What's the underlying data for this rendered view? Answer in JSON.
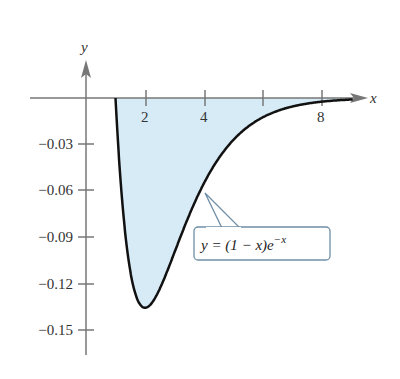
{
  "chart_data": {
    "type": "area",
    "title": "",
    "function_label": "y = (1 − x)e^{−x}",
    "xlabel": "x",
    "ylabel": "y",
    "xlim": [
      -0.2,
      9.2
    ],
    "ylim": [
      -0.15,
      0.0
    ],
    "x_ticks": [
      2,
      4,
      6,
      8
    ],
    "x_tick_labels": [
      "2",
      "4",
      "",
      "8"
    ],
    "y_ticks": [
      -0.03,
      -0.06,
      -0.09,
      -0.12,
      -0.15
    ],
    "y_tick_labels": [
      "−0.03",
      "−0.06",
      "−0.09",
      "−0.12",
      "−0.15"
    ],
    "grid": false,
    "legend": null,
    "shaded_region": {
      "from_x": 1,
      "to_x": 9,
      "fill": "#d7ebf7",
      "between": "curve and x-axis"
    },
    "series": [
      {
        "name": "y = (1 − x)e^{−x}",
        "x": [
          1,
          1.25,
          1.5,
          1.75,
          2,
          2.5,
          3,
          3.5,
          4,
          4.5,
          5,
          5.5,
          6,
          6.5,
          7,
          7.5,
          8,
          8.5,
          9
        ],
        "y": [
          0,
          -0.0716,
          -0.1116,
          -0.1303,
          -0.1353,
          -0.1231,
          -0.0996,
          -0.0755,
          -0.0549,
          -0.0389,
          -0.027,
          -0.0184,
          -0.0124,
          -0.0083,
          -0.0055,
          -0.0036,
          -0.0023,
          -0.0015,
          -0.001
        ]
      }
    ],
    "minimum": {
      "x": 2,
      "y": -0.1353
    }
  },
  "labels": {
    "x_axis": "x",
    "y_axis": "y",
    "callout_prefix": "y = (1 − x)e",
    "callout_exp": "−x",
    "ticks_x": [
      "2",
      "4",
      "8"
    ],
    "ticks_y": [
      "−0.03",
      "−0.06",
      "−0.09",
      "−0.12",
      "−0.15"
    ]
  },
  "colors": {
    "fill": "#d7ebf7",
    "curve": "#111111",
    "axis": "#777777",
    "callout_border": "#6f8fa6"
  }
}
